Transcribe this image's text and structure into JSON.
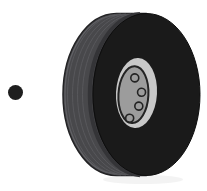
{
  "scene": {
    "alt": "clip-art of a dark rubber wheel with grey hub and four lug holes, black bullet dot at left",
    "background": "#ffffff"
  },
  "bullet": {
    "color": "#1e1e1e"
  },
  "wheel": {
    "colors": {
      "tread": "#48484b",
      "tread_outline": "#222224",
      "tread_groove": "#58585c",
      "tread_highlight": "#646468",
      "tread_shade": "#343437",
      "face": "#1a1a1a",
      "face_outline": "#0d0d0d",
      "hub_outer": "#c8c8c8",
      "hub_inner": "#9c9c9c",
      "outline": "#232323",
      "shadow": "#e9e9e9"
    },
    "lug_count": 4,
    "lug_stroke_width": 1.6,
    "lugs": [
      {
        "cx": 134.0,
        "cy": 78.0,
        "r": 4.0
      },
      {
        "cx": 141.5,
        "cy": 92.0,
        "r": 4.0
      },
      {
        "cx": 139.5,
        "cy": 106.0,
        "r": 4.0
      },
      {
        "cx": 131.0,
        "cy": 118.5,
        "r": 4.0
      }
    ]
  }
}
